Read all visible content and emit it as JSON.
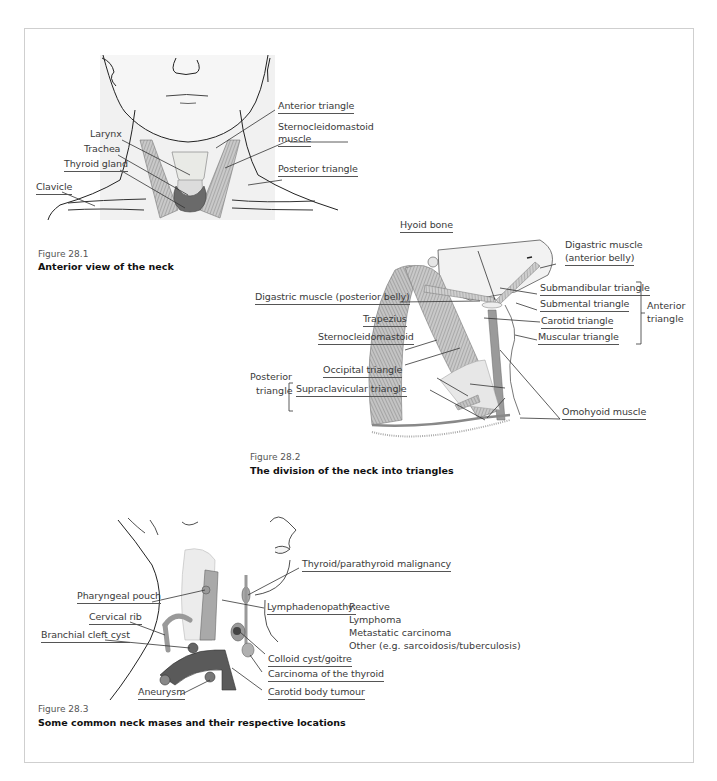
{
  "figures": [
    {
      "number": "Figure 28.1",
      "caption": "Anterior view of the neck",
      "labels": {
        "anterior_triangle": "Anterior triangle",
        "sternocleidomastoid_1": "Sternocleidomastoid",
        "sternocleidomastoid_2": "muscle",
        "larynx": "Larynx",
        "trachea": "Trachea",
        "thyroid_gland": "Thyroid gland",
        "posterior_triangle": "Posterior triangle",
        "clavicle": "Clavicle"
      }
    },
    {
      "number": "Figure 28.2",
      "caption": "The division of the neck into triangles",
      "labels": {
        "hyoid_bone": "Hyoid bone",
        "digastric_anterior_1": "Digastric muscle",
        "digastric_anterior_2": "(anterior belly)",
        "digastric_posterior": "Digastric muscle (posterior belly)",
        "submandibular_triangle": "Submandibular triangle",
        "submental_triangle": "Submental triangle",
        "carotid_triangle": "Carotid triangle",
        "muscular_triangle": "Muscular triangle",
        "anterior_group_1": "Anterior",
        "anterior_group_2": "triangle",
        "trapezius": "Trapezius",
        "sternocleidomastoid": "Sternocleidomastoid",
        "posterior_group_1": "Posterior",
        "posterior_group_2": "triangle",
        "occipital_triangle": "Occipital triangle",
        "supraclavicular_triangle": "Supraclavicular triangle",
        "omohyoid_muscle": "Omohyoid muscle"
      }
    },
    {
      "number": "Figure 28.3",
      "caption": "Some common neck mases and their respective locations",
      "labels": {
        "thyroid_parathyroid": "Thyroid/parathyroid malignancy",
        "pharyngeal_pouch": "Pharyngeal pouch",
        "lymphadenopathy": "Lymphadenopathy:",
        "lymph_causes": [
          "Reactive",
          "Lymphoma",
          "Metastatic carcinoma",
          "Other (e.g. sarcoidosis/tuberculosis)"
        ],
        "cervical_rib": "Cervical rib",
        "branchial_cleft_cyst": "Branchial cleft cyst",
        "colloid_cyst": "Colloid cyst/goitre",
        "carcinoma_thyroid": "Carcinoma of the thyroid",
        "aneurysm": "Aneurysm",
        "carotid_body_tumour": "Carotid body tumour"
      }
    }
  ]
}
